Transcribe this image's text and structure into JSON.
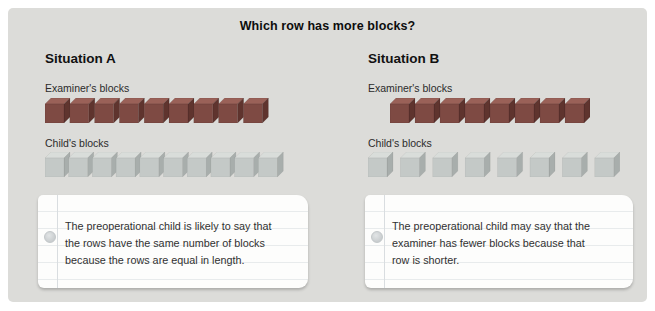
{
  "title": "Which row has more blocks?",
  "colors": {
    "page_bg": "#ffffff",
    "panel_bg": "#dcdcd9",
    "note_bg": "#fdfdfc",
    "cube_palettes": {
      "dark_red": {
        "front": "#7e4a43",
        "top": "#9a6158",
        "side": "#5f342e",
        "edge": "rgba(0,0,0,0.18)"
      },
      "light_gray": {
        "front": "#c4c9c7",
        "top": "#d9ddda",
        "side": "#a8aeac",
        "edge": "rgba(0,0,0,0.10)"
      }
    }
  },
  "situations": [
    {
      "heading": "Situation A",
      "examiner_label": "Examiner's blocks",
      "child_label": "Child's blocks",
      "examiner_row": {
        "count": 9,
        "palette": "dark_red",
        "spacing": 24.8
      },
      "child_row": {
        "count": 10,
        "palette": "light_gray",
        "spacing": 23.7
      },
      "note": "The preoperational child is likely to say that the rows have the same number of blocks because the rows are equal in length."
    },
    {
      "heading": "Situation B",
      "examiner_label": "Examiner's blocks",
      "child_label": "Child's blocks",
      "examiner_row": {
        "count": 8,
        "palette": "dark_red",
        "spacing": 25
      },
      "child_row": {
        "count": 8,
        "palette": "light_gray",
        "spacing": 32.4
      },
      "note": "The preoperational child may say that the examiner has fewer blocks because that row is shorter."
    }
  ]
}
